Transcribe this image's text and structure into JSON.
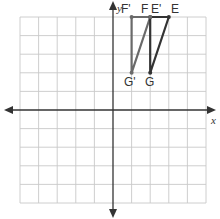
{
  "diagram": {
    "type": "coordinate-plane-translation",
    "grid": {
      "x_min": -5,
      "x_max": 5,
      "y_min": -5,
      "y_max": 5,
      "origin_px": [
        113,
        110
      ],
      "unit_px": 18.6,
      "grid_color": "#c8c8c8",
      "axis_color": "#333333"
    },
    "axes": {
      "x_label": "x",
      "y_label": "y"
    },
    "figures": [
      {
        "name": "original",
        "color": "#333333",
        "vertices": [
          {
            "label": "E",
            "x": 3,
            "y": 5
          },
          {
            "label": "F",
            "x": 2,
            "y": 5
          },
          {
            "label": "G",
            "x": 2,
            "y": 2
          }
        ]
      },
      {
        "name": "image",
        "color": "#6a6a6a",
        "vertices": [
          {
            "label": "E'",
            "x": 2,
            "y": 5
          },
          {
            "label": "F'",
            "x": 1,
            "y": 5
          },
          {
            "label": "G'",
            "x": 1,
            "y": 2
          }
        ]
      }
    ],
    "labels": {
      "E": "E",
      "F": "F",
      "G": "G",
      "E_prime": "E'",
      "F_prime": "F'",
      "G_prime": "G'"
    }
  }
}
